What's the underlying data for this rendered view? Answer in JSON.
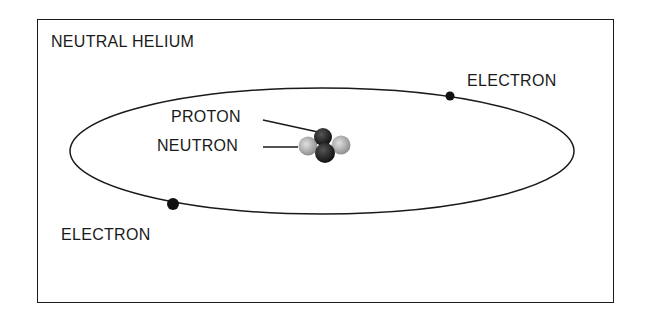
{
  "title": "NEUTRAL HELIUM",
  "labels": {
    "electron_top": "ELECTRON",
    "electron_bottom": "ELECTRON",
    "proton": "PROTON",
    "neutron": "NEUTRON"
  },
  "colors": {
    "ink": "#1a1a1a",
    "proton": "#222222",
    "neutron": "#b8b8b8",
    "background": "#ffffff"
  }
}
